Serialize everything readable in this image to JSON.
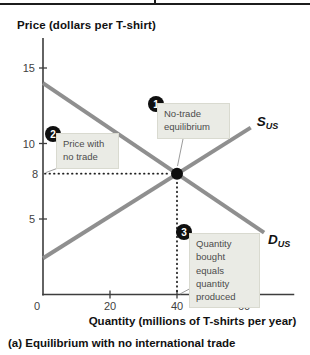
{
  "figure": {
    "ylabel": "Price (dollars per T-shirt)",
    "xlabel": "Quantity (millions of T-shirts per year)",
    "caption": "(a) Equilibrium with no international trade"
  },
  "chart_data": {
    "type": "line",
    "title": "Equilibrium with no international trade",
    "xlabel": "Quantity (millions of T-shirts per year)",
    "ylabel": "Price (dollars per T-shirt)",
    "xlim": [
      0,
      75
    ],
    "ylim": [
      0,
      17
    ],
    "grid": false,
    "xticks": [
      20,
      40,
      60
    ],
    "x_origin_label": "0",
    "yticks": [
      5,
      10,
      15
    ],
    "y_extra_label": 8,
    "series": [
      {
        "name": "supply",
        "label": "S",
        "label_sub": "US",
        "points": [
          [
            0,
            2.4
          ],
          [
            62,
            11.05
          ]
        ]
      },
      {
        "name": "demand",
        "label": "D",
        "label_sub": "US",
        "points": [
          [
            0,
            14.0
          ],
          [
            66,
            4.1
          ]
        ]
      }
    ],
    "equilibrium": {
      "x": 40,
      "y": 8
    },
    "guides": [
      {
        "type": "h",
        "y": 8,
        "from_x": 0,
        "to_x": 40
      },
      {
        "type": "v",
        "x": 40,
        "from_y": 0,
        "to_y": 8
      }
    ]
  },
  "annotations": [
    {
      "num": "1",
      "text": "No-trade\nequilibrium"
    },
    {
      "num": "2",
      "text": "Price with\nno trade"
    },
    {
      "num": "3",
      "text": "Quantity\nbought equals\nquantity\nproduced"
    }
  ],
  "colors": {
    "curve": "#8f8f8f",
    "axis": "#3d3d3d",
    "tick_label": "#3f3f3f",
    "guide_dots": "#1f1f1f",
    "equilibrium_dot": "#0d0d0d",
    "curve_label": "#111111",
    "annotation_box_fill": "#eaebe5",
    "annotation_box_border": "#d9dad0",
    "annotation_text": "#4c4c4c",
    "badge_bg": "#0f0f0f",
    "badge_text": "#ffffff",
    "leader_line": "#9b9b9b",
    "top_rule": "#1c1c1c",
    "title_text": "#111111"
  }
}
